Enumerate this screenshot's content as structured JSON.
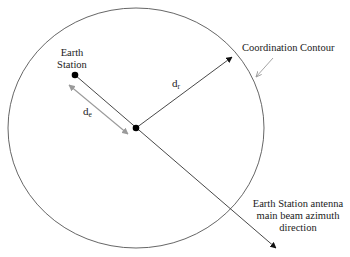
{
  "diagram": {
    "labels": {
      "earth_station_line1": "Earth",
      "earth_station_line2": "Station",
      "coordination_contour": "Coordination Contour",
      "de_main": "d",
      "de_sub": "e",
      "dr_main": "d",
      "dr_sub": "r",
      "beam_line1": "Earth Station antenna",
      "beam_line2": "main beam azimuth",
      "beam_line3": "direction"
    },
    "colors": {
      "stroke": "#333333",
      "contour": "#555555",
      "grey_arrow": "#9a9a9a",
      "dot": "#000000",
      "text": "#1a1a1a"
    },
    "geometry": {
      "contour_center": [
        136,
        128
      ],
      "contour_rx": 128,
      "contour_ry": 120,
      "earth_station": [
        75,
        75
      ],
      "center_point": [
        136,
        128
      ],
      "dr_end": [
        232,
        57
      ],
      "beam_end": [
        276,
        248
      ]
    }
  }
}
